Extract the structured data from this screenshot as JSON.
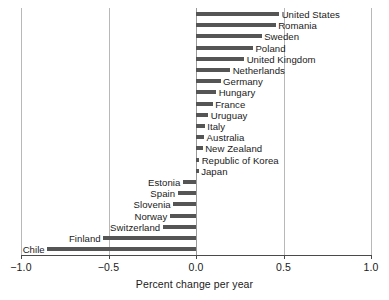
{
  "chart_data": {
    "type": "bar",
    "orientation": "horizontal",
    "title": "",
    "subtitle": "",
    "xlabel": "Percent change per year",
    "ylabel": "",
    "xlim": [
      -1.0,
      1.0
    ],
    "xticks": [
      -1.0,
      -0.5,
      0.0,
      0.5,
      1.0
    ],
    "xtick_labels": [
      "−1.0",
      "−0.5",
      "0.0",
      "0.5",
      "1.0"
    ],
    "grid": true,
    "grid_axis": "x",
    "legend": null,
    "bar_color": "#555555",
    "categories": [
      "United States",
      "Romania",
      "Sweden",
      "Poland",
      "United Kingdom",
      "Netherlands",
      "Germany",
      "Hungary",
      "France",
      "Uruguay",
      "Italy",
      "Australia",
      "New Zealand",
      "Republic of Korea",
      "Japan",
      "Estonia",
      "Spain",
      "Slovenia",
      "Norway",
      "Switzerland",
      "Finland",
      "Chile"
    ],
    "values": [
      0.475,
      0.455,
      0.375,
      0.325,
      0.275,
      0.195,
      0.14,
      0.115,
      0.095,
      0.07,
      0.05,
      0.046,
      0.038,
      0.018,
      0.015,
      -0.075,
      -0.105,
      -0.13,
      -0.15,
      -0.19,
      -0.53,
      -0.85
    ]
  }
}
